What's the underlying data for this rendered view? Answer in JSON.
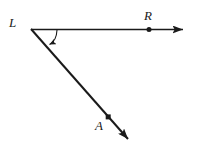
{
  "figure": {
    "kind": "geometry-diagram",
    "background_color": "#ffffff",
    "stroke_color": "#1a1a1a",
    "canvas": {
      "width": 200,
      "height": 149
    },
    "labels": {
      "vertex": "L",
      "ray1_point": "R",
      "ray2_point": "A"
    },
    "points": [
      {
        "name": "L",
        "label": "L",
        "x": 31,
        "y": 29,
        "marker": "none"
      },
      {
        "name": "R",
        "label": "R",
        "x": 149,
        "y": 30,
        "marker": "dot"
      },
      {
        "name": "A",
        "label": "A",
        "x": 108,
        "y": 117,
        "marker": "square"
      }
    ],
    "rays": [
      {
        "name": "ray-LR",
        "from": "L",
        "through": "R",
        "start": {
          "x": 31,
          "y": 29
        },
        "end": {
          "x": 186,
          "y": 30
        },
        "arrowhead": "end"
      },
      {
        "name": "ray-LA",
        "from": "L",
        "through": "A",
        "start": {
          "x": 31,
          "y": 29
        },
        "end": {
          "x": 134,
          "y": 146
        },
        "arrowhead": "end"
      }
    ],
    "angle_arc": {
      "name": "angle-RLA",
      "vertex": "L",
      "from_ray": "ray-LR",
      "to_ray": "ray-LA",
      "arrowhead": "end"
    }
  }
}
